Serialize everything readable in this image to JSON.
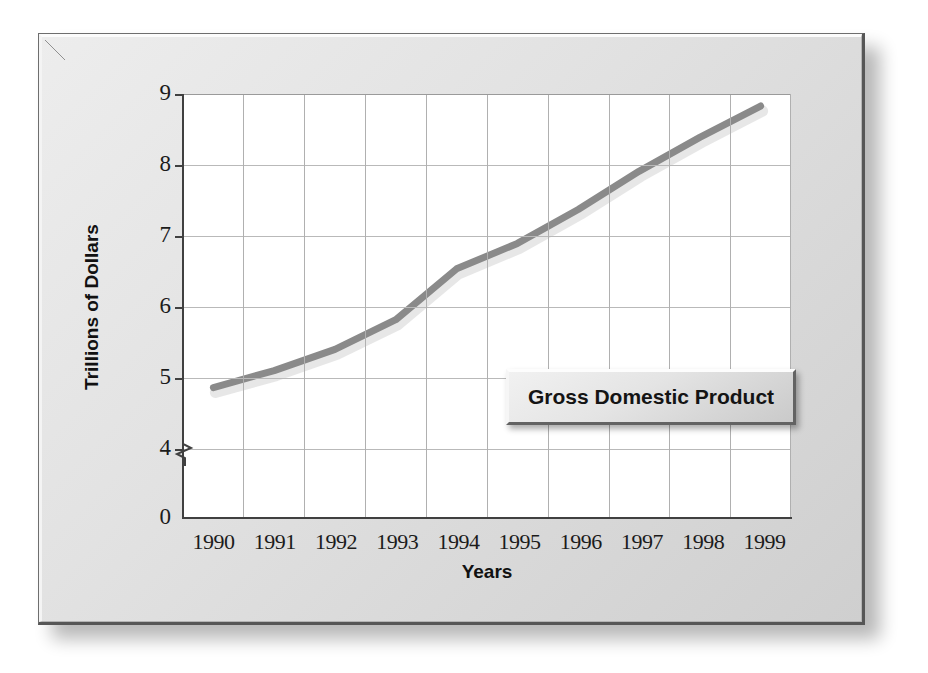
{
  "figure": {
    "panel_background": "#e2e2e2",
    "plot_background": "#ffffff",
    "line_color": "#8a8a8a",
    "line_shadow_color": "#c9c9c9",
    "grid_color": "#b9b9b9",
    "axis_color": "#404040"
  },
  "legend": {
    "label": "Gross Domestic Product"
  },
  "axes": {
    "x_title": "Years",
    "y_title": "Trillions of Dollars",
    "y_ticks": [
      "9",
      "8",
      "7",
      "6",
      "5",
      "4",
      "0"
    ],
    "axis_break_between": [
      "4",
      "0"
    ]
  },
  "chart_data": {
    "type": "line",
    "title": "Gross Domestic Product",
    "xlabel": "Years",
    "ylabel": "Trillions of Dollars",
    "categories": [
      "1990",
      "1991",
      "1992",
      "1993",
      "1994",
      "1995",
      "1996",
      "1997",
      "1998",
      "1999"
    ],
    "series": [
      {
        "name": "Gross Domestic Product",
        "values": [
          5.55,
          5.75,
          6.0,
          6.35,
          6.95,
          7.25,
          7.65,
          8.1,
          8.5,
          8.87
        ]
      }
    ],
    "ylim": [
      4,
      9
    ],
    "y_ticks": [
      4,
      5,
      6,
      7,
      8,
      9
    ],
    "y_axis_broken": true,
    "y_axis_break_label": "0",
    "grid": true,
    "legend_position": "inside-lower-right",
    "units": "Trillions of Dollars"
  }
}
